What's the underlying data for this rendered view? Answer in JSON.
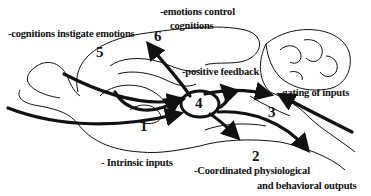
{
  "diagram": {
    "type": "brain-circuit-schematic",
    "colors": {
      "line": "#111111",
      "background": "#ffffff"
    },
    "labels": {
      "cognitions_instigate": "-cognitions instigate emotions",
      "emotions_control_line1": "-emotions control",
      "emotions_control_line2": "cognitions",
      "positive_feedback": "-positive feedback",
      "gating_inputs": "-gating of inputs",
      "intrinsic_inputs": "- Intrinsic inputs",
      "outputs_line1": "-Coordinated physiological",
      "outputs_line2": "and behavioral outputs"
    },
    "numbers": {
      "n1": "1",
      "n2": "2",
      "n3": "3",
      "n4": "4",
      "n5": "5",
      "n6": "6"
    }
  }
}
